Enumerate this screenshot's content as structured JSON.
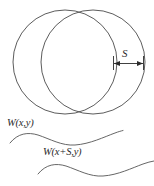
{
  "figure": {
    "name": "lateral-shearing-interferometer-diagram",
    "background_color": "#ffffff",
    "line_color": "#4a4a4a",
    "text_color": "#2b2b2b",
    "labels": {
      "shear_amount": "S",
      "wavefront_original": "W(x,y)",
      "wavefront_sheared": "W(x+S,y)"
    },
    "circles": [
      {
        "name": "left-beam-circle",
        "cx": 65,
        "cy": 62,
        "r": 52
      },
      {
        "name": "right-beam-circle",
        "cx": 93,
        "cy": 62,
        "r": 52
      }
    ],
    "dimension": {
      "name": "shear-dimension",
      "label": "S",
      "x_start": 113,
      "x_end": 144,
      "y": 63
    },
    "waves": [
      {
        "name": "wavefront-curve-original",
        "label": "W(x,y)",
        "x_start": 10,
        "x_end": 123,
        "baseline_y": 140,
        "amplitude": 6
      },
      {
        "name": "wavefront-curve-sheared",
        "label": "W(x+S,y)",
        "x_start": 38,
        "x_end": 154,
        "baseline_y": 171,
        "amplitude": 6
      }
    ]
  }
}
